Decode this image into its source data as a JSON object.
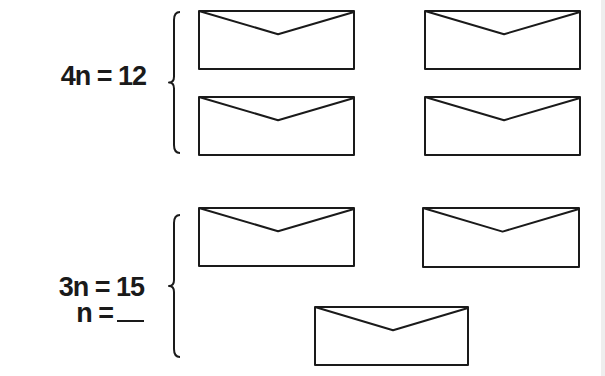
{
  "groups": [
    {
      "id": "group-1",
      "equation_lines": [
        "4n = 12"
      ],
      "envelope_count": 4,
      "envelopes": [
        {
          "x": 199,
          "y": 11,
          "w": 155,
          "h": 58
        },
        {
          "x": 425,
          "y": 11,
          "w": 155,
          "h": 58
        },
        {
          "x": 199,
          "y": 97,
          "w": 155,
          "h": 58
        },
        {
          "x": 425,
          "y": 97,
          "w": 155,
          "h": 58
        }
      ],
      "brace": {
        "x": 172,
        "top": 12,
        "bottom": 153
      }
    },
    {
      "id": "group-2",
      "equation_lines": [
        "3n = 15",
        "n ="
      ],
      "answer_blank": "",
      "envelope_count": 3,
      "envelopes": [
        {
          "x": 199,
          "y": 208,
          "w": 155,
          "h": 58
        },
        {
          "x": 423,
          "y": 208,
          "w": 156,
          "h": 59
        },
        {
          "x": 315,
          "y": 307,
          "w": 153,
          "h": 58
        }
      ],
      "brace": {
        "x": 172,
        "top": 215,
        "bottom": 357
      }
    }
  ],
  "colors": {
    "ink": "#1a1a1a",
    "paper": "#ffffff"
  }
}
